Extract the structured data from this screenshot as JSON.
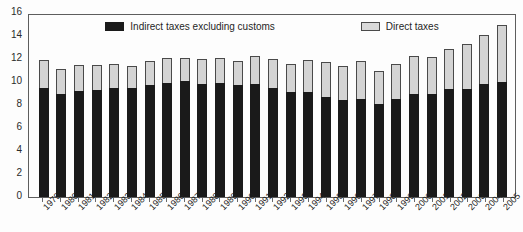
{
  "chart_data": {
    "type": "bar",
    "stacked": true,
    "title": "",
    "subtitle": "",
    "xlabel": "",
    "ylabel": "",
    "ylim": [
      0,
      16
    ],
    "ytick_step": 2,
    "ytick_labels": [
      "16",
      "14",
      "12",
      "10",
      "8",
      "6",
      "4",
      "2",
      "0"
    ],
    "ytick_values": [
      16,
      14,
      12,
      10,
      8,
      6,
      4,
      2,
      0
    ],
    "grid": false,
    "legend_position": "top-inside",
    "categories": [
      "1979",
      "1980",
      "1981",
      "1982",
      "1983",
      "1984",
      "1985",
      "1986",
      "1987",
      "1988",
      "1989",
      "1990",
      "1991",
      "1992",
      "1993",
      "1994",
      "1995",
      "1996",
      "1997",
      "1998",
      "1999",
      "2000",
      "2001",
      "2002",
      "2003",
      "2004",
      "2005"
    ],
    "series": [
      {
        "name": "Indirect taxes excluding customs",
        "color": "#1a1a1a",
        "values": [
          9.5,
          9.0,
          9.2,
          9.3,
          9.5,
          9.5,
          9.7,
          9.9,
          10.1,
          9.8,
          9.9,
          9.7,
          9.8,
          9.5,
          9.1,
          9.1,
          8.7,
          8.4,
          8.5,
          8.1,
          8.5,
          9.0,
          9.0,
          9.4,
          9.4,
          9.8,
          10.0
        ]
      },
      {
        "name": "Direct taxes",
        "color": "#d4d4d4",
        "values": [
          2.4,
          2.1,
          2.3,
          2.2,
          2.1,
          1.9,
          2.1,
          2.2,
          2.0,
          2.2,
          2.2,
          2.1,
          2.5,
          2.5,
          2.5,
          2.8,
          3.0,
          3.0,
          3.3,
          2.9,
          3.1,
          3.3,
          3.2,
          3.5,
          3.9,
          4.3,
          5.0
        ]
      }
    ],
    "totals": [
      11.9,
      11.1,
      11.5,
      11.5,
      11.6,
      11.4,
      11.8,
      12.1,
      12.1,
      12.0,
      12.1,
      11.8,
      12.3,
      12.0,
      11.6,
      11.9,
      11.7,
      11.4,
      11.8,
      11.0,
      11.6,
      12.3,
      12.2,
      12.9,
      13.3,
      14.1,
      15.0
    ]
  },
  "legend": {
    "entries": [
      {
        "label": "Indirect taxes excluding customs",
        "swatch": "dark"
      },
      {
        "label": "Direct taxes",
        "swatch": "light"
      }
    ]
  }
}
